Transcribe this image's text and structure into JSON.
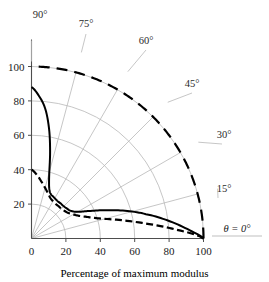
{
  "chart_data": {
    "type": "line",
    "subtype": "polar-quadrant",
    "title": "",
    "xlabel": "Percentage of maximum modulus",
    "ylabel": "",
    "angle_unit": "degrees",
    "radial_axis": {
      "ticks": [
        0,
        20,
        40,
        60,
        80,
        100
      ],
      "tick_labels": [
        "0",
        "20",
        "40",
        "60",
        "80",
        "100"
      ],
      "range": [
        0,
        100
      ],
      "grid_radii": [
        20,
        40,
        60,
        80,
        100
      ]
    },
    "vertical_axis": {
      "ticks": [
        20,
        40,
        60,
        80,
        100
      ],
      "tick_labels": [
        "20",
        "40",
        "60",
        "80",
        "100"
      ],
      "range": [
        0,
        100
      ]
    },
    "angular_axis": {
      "range": [
        0,
        90
      ],
      "ray_angles": [
        0,
        15,
        30,
        45,
        60,
        75,
        90
      ],
      "labels": [
        "θ = 0°",
        "15°",
        "30°",
        "45°",
        "60°",
        "75°",
        "90°"
      ],
      "grid": true
    },
    "legend": {
      "visible": false,
      "position": "none"
    },
    "series": [
      {
        "name": "outer-envelope",
        "style": "long-dashed",
        "color": "#000000",
        "angles": [
          0,
          5,
          10,
          15,
          20,
          25,
          30,
          35,
          40,
          45,
          50,
          55,
          60,
          65,
          70,
          75,
          80,
          85,
          90
        ],
        "values": [
          100,
          100,
          100,
          100,
          100,
          100,
          100,
          100,
          100,
          100,
          100,
          100,
          100,
          100,
          100,
          100,
          100,
          100,
          100
        ]
      },
      {
        "name": "solid-curve",
        "style": "solid",
        "color": "#000000",
        "angles": [
          0,
          3,
          6,
          9,
          12,
          16,
          20,
          25,
          30,
          35,
          40,
          45,
          50,
          55,
          60,
          63,
          66,
          69,
          72,
          75,
          78,
          81,
          84,
          87,
          90
        ],
        "values": [
          100,
          92,
          84,
          76,
          68,
          58,
          48,
          38,
          31,
          28,
          27,
          26.5,
          26.5,
          26.5,
          27,
          27.5,
          28,
          29.5,
          33,
          40,
          52,
          65,
          76,
          83,
          88
        ]
      },
      {
        "name": "dash-dot-curve",
        "style": "dash-dot",
        "color": "#000000",
        "angles": [
          0,
          4,
          8,
          12,
          16,
          20,
          25,
          30,
          35,
          40,
          45,
          50,
          55,
          60,
          65,
          70,
          75,
          80,
          85,
          90
        ],
        "values": [
          100,
          82,
          65,
          52,
          42,
          36,
          31,
          28,
          26,
          25,
          24.5,
          24.5,
          24.5,
          25,
          26,
          28,
          30.5,
          33.5,
          37,
          40
        ]
      }
    ]
  },
  "axes": {
    "x_tick_labels": [
      "0",
      "20",
      "40",
      "60",
      "80",
      "100"
    ],
    "y_tick_labels": [
      "20",
      "40",
      "60",
      "80",
      "100"
    ],
    "caption": "Percentage of maximum modulus"
  },
  "angle_annotations": [
    {
      "label": "90°",
      "angle": 90
    },
    {
      "label": "75°",
      "angle": 75
    },
    {
      "label": "60°",
      "angle": 60
    },
    {
      "label": "45°",
      "angle": 45
    },
    {
      "label": "30°",
      "angle": 30
    },
    {
      "label": "15°",
      "angle": 15
    },
    {
      "label": "θ = 0°",
      "angle": 0
    }
  ],
  "colors": {
    "axis": "#4d4d4d",
    "grid": "#b8b8b8",
    "curve": "#000000",
    "text": "#1a1a1a",
    "background": "#ffffff"
  }
}
